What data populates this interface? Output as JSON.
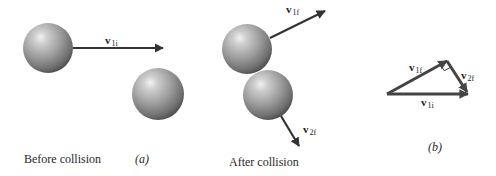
{
  "figure": {
    "panel_a": {
      "caption_left": "Before collision",
      "caption_tag": "(a)",
      "ball1": {
        "cx": 48,
        "cy": 48,
        "r": 25
      },
      "ball2": {
        "cx": 158,
        "cy": 94,
        "r": 26
      },
      "v1i": {
        "symbol": "v",
        "subscript": "1i",
        "x1": 73,
        "y1": 48,
        "x2": 163,
        "y2": 48
      }
    },
    "panel_after": {
      "caption": "After collision",
      "ball1": {
        "cx": 247,
        "cy": 49,
        "r": 25
      },
      "ball2": {
        "cx": 268,
        "cy": 95,
        "r": 25
      },
      "v1f": {
        "symbol": "v",
        "subscript": "1f",
        "x1": 270,
        "y1": 38,
        "x2": 325,
        "y2": 11
      },
      "v2f": {
        "symbol": "v",
        "subscript": "2f",
        "x1": 281,
        "y1": 116,
        "x2": 299,
        "y2": 146
      }
    },
    "panel_b": {
      "caption_tag": "(b)",
      "origin": {
        "x": 387,
        "y": 94
      },
      "v1f_tip": {
        "x": 447,
        "y": 61
      },
      "v1i_tip": {
        "x": 468,
        "y": 94
      },
      "labels": {
        "v1f": {
          "symbol": "v",
          "subscript": "1f"
        },
        "v2f": {
          "symbol": "v",
          "subscript": "2f"
        },
        "v1i": {
          "symbol": "v",
          "subscript": "1i"
        }
      }
    },
    "colors": {
      "arrow": "#333333",
      "sphere_highlight": "#eeeeee",
      "sphere_mid": "#9c9c9c",
      "sphere_dark": "#4a4a4a",
      "background": "#ffffff"
    }
  }
}
